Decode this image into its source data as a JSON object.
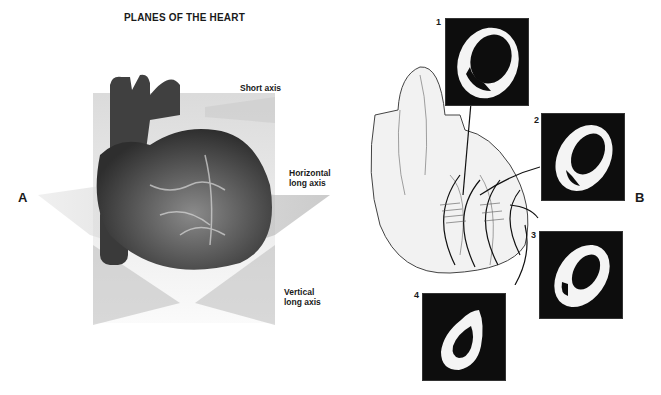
{
  "title": "PLANES OF THE HEART",
  "panels": {
    "a": {
      "label": "A"
    },
    "b": {
      "label": "B"
    }
  },
  "axis_labels": {
    "short": "Short axis",
    "horizontal_line1": "Horizontal",
    "horizontal_line2": "long axis",
    "vertical_line1": "Vertical",
    "vertical_line2": "long axis"
  },
  "slices": [
    {
      "number": "1"
    },
    {
      "number": "2"
    },
    {
      "number": "3"
    },
    {
      "number": "4"
    }
  ],
  "colors": {
    "background": "#ffffff",
    "text": "#1a1a1a",
    "heart_dark": "#3a3a3a",
    "plane_gray": "#cfcfcf",
    "mri_black": "#0d0d0d",
    "mri_white": "#f4f4f4"
  }
}
